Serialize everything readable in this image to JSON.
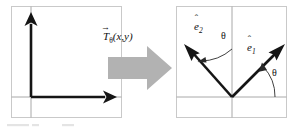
{
  "figure": {
    "caption_partial": "Figure",
    "background_color": "#ffffff",
    "frame_color": "#c9c9c9",
    "axis_color": "#a8a8a8",
    "vector_color": "#151515",
    "block_arrow_color": "#b2b2b2"
  },
  "labels": {
    "transform": {
      "symbol": "T",
      "vector_accent": "→",
      "subscript": "θ",
      "arguments": "(x,y)",
      "full": "Tθ(x,y)"
    },
    "e1": {
      "symbol": "e",
      "hat_accent": "ˆ",
      "subscript": "1",
      "full": "ê1"
    },
    "e2": {
      "symbol": "e",
      "hat_accent": "ˆ",
      "subscript": "2",
      "full": "ê2"
    },
    "theta_upper": "θ",
    "theta_lower": "θ"
  },
  "left_panel": {
    "name": "original-basis-panel",
    "description": "Standard basis: unit vector along positive x-axis and unit vector along positive y-axis",
    "origin": [
      31,
      97
    ],
    "vectors": [
      {
        "name": "x-axis-vector",
        "angle_deg": 0,
        "direction": "right",
        "tip": [
          112,
          97
        ]
      },
      {
        "name": "y-axis-vector",
        "angle_deg": 90,
        "direction": "up",
        "tip": [
          31,
          15
        ]
      }
    ],
    "frame": {
      "x": 11,
      "y": 6,
      "width": 111,
      "height": 112
    }
  },
  "right_panel": {
    "name": "rotated-basis-panel",
    "description": "Rotated basis: e1 rotated by theta above horizontal axis, e2 rotated by theta from vertical axis",
    "origin": [
      232,
      97
    ],
    "vectors": [
      {
        "name": "e1-vector",
        "angle_deg": 45,
        "direction": "upper-right",
        "tip": [
          288,
          41
        ]
      },
      {
        "name": "e2-vector",
        "angle_deg": 135,
        "direction": "upper-left",
        "tip": [
          183,
          41
        ]
      }
    ],
    "angles": [
      {
        "name": "theta-from-vertical-to-e2",
        "value": "θ",
        "from": "vertical-axis",
        "to": "e2"
      },
      {
        "name": "theta-from-horizontal-to-e1",
        "value": "θ",
        "from": "horizontal-axis",
        "to": "e1"
      }
    ],
    "frame": {
      "x": 176,
      "y": 6,
      "width": 111,
      "height": 112
    }
  },
  "connector": {
    "name": "transformation-block-arrow",
    "direction": "right",
    "label_ref": "labels.transform.full"
  }
}
